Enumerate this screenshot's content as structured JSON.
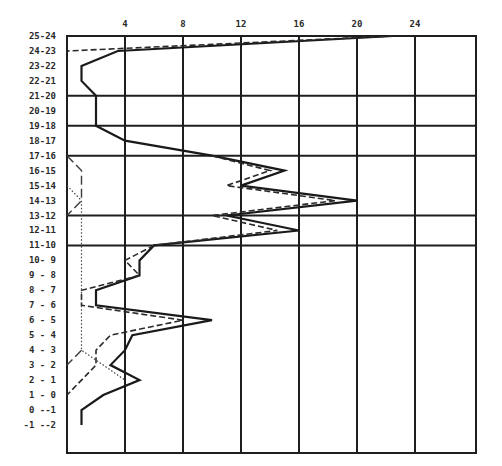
{
  "chart_data": {
    "type": "line",
    "orientation": "horizontal-values-vertical-categories",
    "title": "",
    "xlabel": "",
    "ylabel": "",
    "x_ticks": [
      4,
      8,
      12,
      16,
      20,
      24
    ],
    "xlim": [
      0,
      28
    ],
    "grid": true,
    "major_row_lines_after": [
      "21-20",
      "19-18",
      "17-16",
      "13-12",
      "11-10",
      "9-8",
      "5-4",
      "1-0"
    ],
    "categories": [
      "25-24",
      "24-23",
      "23-22",
      "22-21",
      "21-20",
      "20-19",
      "19-18",
      "18-17",
      "17-16",
      "16-15",
      "15-14",
      "14-13",
      "13-12",
      "12-11",
      "11-10",
      "10- 9",
      "9 - 8",
      "8 - 7",
      "7 - 6",
      "6 - 5",
      "5 - 4",
      "4 - 3",
      "3 - 2",
      "2 - 1",
      "1 - 0",
      "0 --1",
      "-1 --2"
    ],
    "series": [
      {
        "name": "solid",
        "style": "solid",
        "values": [
          22.5,
          3.5,
          1.0,
          1.0,
          2.0,
          2.0,
          2.0,
          4.0,
          10.0,
          15.0,
          12.0,
          20.0,
          11.0,
          16.0,
          6.0,
          5.0,
          5.0,
          2.0,
          2.0,
          10.0,
          4.5,
          4.0,
          3.0,
          5.0,
          2.5,
          1.0,
          1.0
        ]
      },
      {
        "name": "dashed",
        "style": "dashed",
        "values": [
          22.5,
          0.0,
          null,
          null,
          null,
          null,
          null,
          null,
          10.0,
          14.0,
          11.0,
          18.5,
          10.0,
          14.5,
          6.0,
          4.0,
          5.0,
          1.0,
          1.0,
          8.0,
          3.0,
          2.0,
          2.0,
          1.0,
          0.0,
          null,
          null
        ]
      },
      {
        "name": "long-dashed",
        "style": "longdash",
        "values": [
          null,
          null,
          null,
          null,
          null,
          null,
          null,
          null,
          0.0,
          1.0,
          1.0,
          1.0,
          0.0,
          null,
          null,
          null,
          null,
          null,
          null,
          null,
          null,
          1.0,
          0.0,
          null,
          null,
          null,
          null
        ]
      },
      {
        "name": "dotted",
        "style": "dotted",
        "values": [
          null,
          null,
          null,
          null,
          null,
          null,
          null,
          null,
          null,
          null,
          0.0,
          1.0,
          1.0,
          1.0,
          1.0,
          1.0,
          1.0,
          1.0,
          1.0,
          1.0,
          1.0,
          1.0,
          2.5,
          4.0,
          null,
          null,
          null
        ]
      }
    ]
  },
  "axis": {
    "tick_labels": [
      "4",
      "8",
      "12",
      "16",
      "20",
      "24"
    ]
  }
}
